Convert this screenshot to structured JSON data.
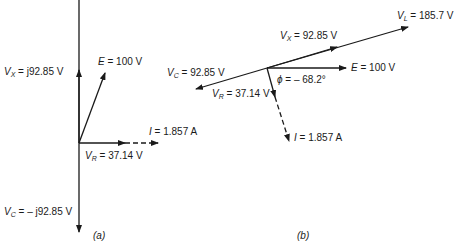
{
  "diagram_a": {
    "caption": "(a)",
    "labels": {
      "vx": {
        "sym": "V",
        "sub": "X",
        "value": " = j92.85 V"
      },
      "e": {
        "sym": "E",
        "value": " = 100 V"
      },
      "i": {
        "sym": "I",
        "value": " = 1.857 A"
      },
      "vr": {
        "sym": "V",
        "sub": "R",
        "value": " = 37.14 V"
      },
      "vc": {
        "sym": "V",
        "sub": "C",
        "value": " = – j92.85 V"
      }
    }
  },
  "diagram_b": {
    "caption": "(b)",
    "labels": {
      "vl": {
        "sym": "V",
        "sub": "L",
        "value": " = 185.7 V"
      },
      "vx": {
        "sym": "V",
        "sub": "X",
        "value": " = 92.85 V"
      },
      "vc": {
        "sym": "V",
        "sub": "C",
        "value": " = 92.85 V"
      },
      "e": {
        "sym": "E",
        "value": " = 100 V"
      },
      "phi": {
        "sym": "ϕ",
        "value": " = – 68.2°"
      },
      "vr": {
        "sym": "V",
        "sub": "R",
        "value": " = 37.14 V"
      },
      "i": {
        "sym": "I",
        "value": " = 1.857 A"
      }
    }
  },
  "colors": {
    "ink": "#1a1a1a",
    "background": "#ffffff"
  }
}
